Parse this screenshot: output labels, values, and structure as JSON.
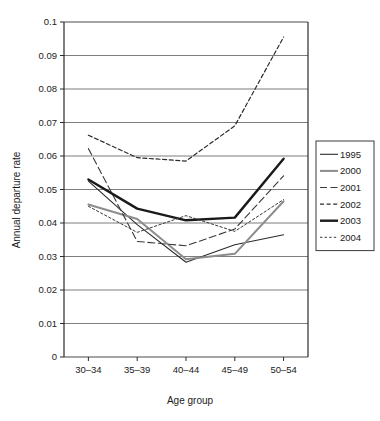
{
  "chart_data": {
    "type": "line",
    "title": "",
    "xlabel": "Age group",
    "ylabel": "Annual departure rate",
    "categories": [
      "30–34",
      "35–39",
      "40–44",
      "45–49",
      "50–54"
    ],
    "ylim": [
      0,
      0.1
    ],
    "yticks": [
      0,
      0.01,
      0.02,
      0.03,
      0.04,
      0.05,
      0.06,
      0.07,
      0.08,
      0.09,
      0.1
    ],
    "ytick_labels": [
      "0",
      "0.01",
      "0.02",
      "0.03",
      "0.04",
      "0.05",
      "0.06",
      "0.07",
      "0.08",
      "0.09",
      "0.1"
    ],
    "grid": true,
    "legend_position": "right",
    "series": [
      {
        "name": "1995",
        "values": [
          0.0525,
          0.0395,
          0.0283,
          0.0335,
          0.0365
        ],
        "color": "#2b2b2b",
        "style": "solid",
        "width": 1.1
      },
      {
        "name": "2000",
        "values": [
          0.0455,
          0.0412,
          0.0292,
          0.0308,
          0.0465
        ],
        "color": "#8c8c8c",
        "style": "solid",
        "width": 2.0
      },
      {
        "name": "2001",
        "values": [
          0.0622,
          0.0345,
          0.0332,
          0.0382,
          0.0541
        ],
        "color": "#3a3a3a",
        "style": "dashed-long",
        "width": 1.1
      },
      {
        "name": "2002",
        "values": [
          0.0662,
          0.0595,
          0.0585,
          0.069,
          0.0955
        ],
        "color": "#2b2b2b",
        "style": "dashed-short",
        "width": 1.2
      },
      {
        "name": "2003",
        "values": [
          0.053,
          0.0443,
          0.0408,
          0.0416,
          0.0592
        ],
        "color": "#1a1a1a",
        "style": "solid",
        "width": 2.4
      },
      {
        "name": "2004",
        "values": [
          0.045,
          0.0372,
          0.0422,
          0.0375,
          0.047
        ],
        "color": "#3a3a3a",
        "style": "dashed-fine",
        "width": 1.0
      }
    ]
  },
  "legend": {
    "items": [
      {
        "label": "1995"
      },
      {
        "label": "2000"
      },
      {
        "label": "2001"
      },
      {
        "label": "2002"
      },
      {
        "label": "2003"
      },
      {
        "label": "2004"
      }
    ]
  },
  "axes": {
    "y_title": "Annual departure rate",
    "x_title": "Age group"
  }
}
